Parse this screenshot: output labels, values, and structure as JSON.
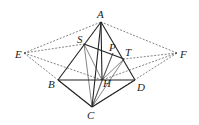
{
  "diagram": {
    "title": "",
    "points": {
      "A": {
        "x": 101,
        "y": 22,
        "lx": 97,
        "ly": 18
      },
      "S": {
        "x": 84,
        "y": 44,
        "lx": 77,
        "ly": 43
      },
      "P": {
        "x": 113,
        "y": 53,
        "lx": 109,
        "ly": 51
      },
      "T": {
        "x": 124,
        "y": 59,
        "lx": 125,
        "ly": 56
      },
      "E": {
        "x": 24,
        "y": 53,
        "lx": 15,
        "ly": 58
      },
      "F": {
        "x": 177,
        "y": 53,
        "lx": 180,
        "ly": 58
      },
      "B": {
        "x": 58,
        "y": 80,
        "lx": 48,
        "ly": 88
      },
      "H": {
        "x": 102,
        "y": 80,
        "lx": 103,
        "ly": 87
      },
      "D": {
        "x": 135,
        "y": 80,
        "lx": 137,
        "ly": 91
      },
      "C": {
        "x": 92,
        "y": 107,
        "lx": 87,
        "ly": 119
      }
    },
    "labels": [
      "A",
      "S",
      "P",
      "T",
      "E",
      "F",
      "B",
      "H",
      "D",
      "C"
    ],
    "solid_edges": [
      [
        "A",
        "B"
      ],
      [
        "A",
        "D"
      ],
      [
        "B",
        "D"
      ],
      [
        "B",
        "C"
      ],
      [
        "C",
        "D"
      ],
      [
        "A",
        "C"
      ],
      [
        "A",
        "H"
      ],
      [
        "S",
        "T"
      ]
    ],
    "thin_edges": [
      [
        "S",
        "C"
      ],
      [
        "S",
        "H"
      ],
      [
        "T",
        "C"
      ],
      [
        "T",
        "H"
      ],
      [
        "P",
        "H"
      ],
      [
        "P",
        "C"
      ],
      [
        "H",
        "C"
      ]
    ],
    "dashed_edges": [
      [
        "E",
        "A"
      ],
      [
        "E",
        "S"
      ],
      [
        "E",
        "H"
      ],
      [
        "E",
        "C"
      ],
      [
        "F",
        "A"
      ],
      [
        "F",
        "T"
      ],
      [
        "F",
        "H"
      ],
      [
        "F",
        "C"
      ]
    ]
  }
}
